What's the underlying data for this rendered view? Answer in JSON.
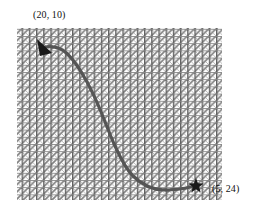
{
  "figure": {
    "type": "path-diagram",
    "background_color": "#ffffff",
    "region": {
      "name": "hatched-area",
      "fill_pattern": "cross-hatch-vertical-diagonal",
      "pattern_color": "#6e6e6e",
      "pattern_background": "#ffffff",
      "x": 17,
      "y": 28,
      "width": 205,
      "height": 172
    },
    "path": {
      "name": "trajectory-curve",
      "color": "#555555",
      "stroke_width": 3.2,
      "description": "S-shaped curve from star marker at lower right to arrowhead at upper left",
      "points": [
        [
          196,
          186
        ],
        [
          184,
          188
        ],
        [
          170,
          190
        ],
        [
          156,
          189
        ],
        [
          144,
          185
        ],
        [
          134,
          178
        ],
        [
          126,
          169
        ],
        [
          119,
          157
        ],
        [
          113,
          143
        ],
        [
          107,
          128
        ],
        [
          101,
          114
        ],
        [
          95,
          100
        ],
        [
          88,
          86
        ],
        [
          80,
          72
        ],
        [
          72,
          60
        ],
        [
          64,
          52
        ],
        [
          56,
          48
        ],
        [
          50,
          47
        ],
        [
          45,
          47
        ]
      ]
    },
    "markers": [
      {
        "name": "arrowhead-marker",
        "shape": "triangle",
        "color": "#1a1a1a",
        "x": 44,
        "y": 48,
        "angle_deg": 200,
        "size": 11,
        "label": "(20, 10)",
        "label_x": 33,
        "label_y": 9
      },
      {
        "name": "star-marker",
        "shape": "star-5-point",
        "color": "#1a1a1a",
        "x": 196,
        "y": 186,
        "size": 8,
        "label": "(5, 24)",
        "label_x": 212,
        "label_y": 183
      }
    ]
  },
  "labels": {
    "start": "(20, 10)",
    "end": "(5, 24)"
  }
}
